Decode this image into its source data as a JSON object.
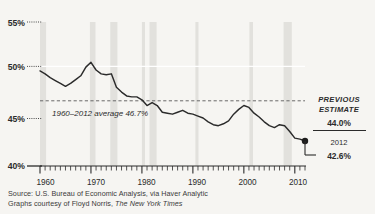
{
  "chart_data": {
    "type": "line",
    "title": "",
    "subtitle": "",
    "xlabel": "",
    "ylabel": "",
    "xlim": [
      1960,
      2012
    ],
    "ylim": [
      40,
      55
    ],
    "ytick_labels": [
      "55%",
      "50%",
      "45%",
      "40%"
    ],
    "ytick_values": [
      55,
      50,
      45,
      40
    ],
    "xtick_labels": [
      "1960",
      "1970",
      "1980",
      "1990",
      "2000",
      "2010"
    ],
    "xtick_values": [
      1960,
      1970,
      1980,
      1990,
      2000,
      2010
    ],
    "grid": false,
    "legend": "none",
    "series": [
      {
        "name": "Labor share of income",
        "x": [
          1960,
          1961,
          1962,
          1963,
          1964,
          1965,
          1966,
          1967,
          1968,
          1969,
          1970,
          1971,
          1972,
          1973,
          1974,
          1975,
          1976,
          1977,
          1978,
          1979,
          1980,
          1981,
          1982,
          1983,
          1984,
          1985,
          1986,
          1987,
          1988,
          1989,
          1990,
          1991,
          1992,
          1993,
          1994,
          1995,
          1996,
          1997,
          1998,
          1999,
          2000,
          2001,
          2002,
          2003,
          2004,
          2005,
          2006,
          2007,
          2008,
          2009,
          2010,
          2011,
          2012
        ],
        "values": [
          49.9,
          49.6,
          49.2,
          48.9,
          48.6,
          48.3,
          48.6,
          49.0,
          49.4,
          50.3,
          50.8,
          50.0,
          49.6,
          49.5,
          49.6,
          48.2,
          47.7,
          47.3,
          47.2,
          47.2,
          46.9,
          46.3,
          46.6,
          46.3,
          45.6,
          45.5,
          45.4,
          45.6,
          45.8,
          45.5,
          45.4,
          45.2,
          45.0,
          44.6,
          44.3,
          44.2,
          44.4,
          44.7,
          45.4,
          45.9,
          46.3,
          46.1,
          45.5,
          45.1,
          44.6,
          44.2,
          44.0,
          44.3,
          44.2,
          43.6,
          42.9,
          42.8,
          42.6
        ]
      }
    ],
    "reference_lines": [
      {
        "name": "average",
        "value": 46.7,
        "style": "dashed",
        "label": "1960–2012 average 46.7%"
      },
      {
        "name": "fifty-percent",
        "value": 50,
        "style": "solid-white"
      }
    ],
    "shaded_bands": [
      {
        "start": 1960.0,
        "end": 1961.2
      },
      {
        "start": 1969.8,
        "end": 1970.9
      },
      {
        "start": 1973.8,
        "end": 1975.2
      },
      {
        "start": 1980.0,
        "end": 1980.6
      },
      {
        "start": 1981.5,
        "end": 1982.9
      },
      {
        "start": 1990.6,
        "end": 1991.2
      },
      {
        "start": 2001.2,
        "end": 2001.9
      },
      {
        "start": 2007.9,
        "end": 2009.5
      }
    ],
    "endpoint_marker": {
      "x": 2012,
      "y": 42.6
    },
    "annotations": {
      "previous_estimate_line1": "PREVIOUS",
      "previous_estimate_line2": "ESTIMATE",
      "previous_estimate_value": "44.0%",
      "current_year": "2012",
      "current_value": "42.6%",
      "average_label": "1960–2012 average 46.7%"
    },
    "colors": {
      "background": "#f6f5f2",
      "band": "#e2e1dd",
      "line": "#2b2b2b",
      "dashed": "#5a5a5a",
      "white_rule": "#ffffff"
    }
  },
  "source": {
    "line1": "Source: U.S. Bureau of Economic Analysis, via Haver Analytic",
    "line2_prefix": "Graphs courtesy of Floyd Norris, ",
    "line2_italic": "The New York Times"
  }
}
